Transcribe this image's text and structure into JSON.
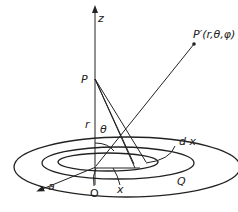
{
  "figure": {
    "labels": {
      "z_axis": "z",
      "field_point_general": "P′(r,θ,φ)",
      "field_point_axis": "P",
      "distance_r": "r",
      "angle_theta": "θ",
      "element_width": "d x",
      "ring_radius": "x",
      "origin": "O",
      "radius_a": "a",
      "outer_edge": "Q"
    },
    "colors": {
      "stroke": "#222222",
      "background": "#ffffff"
    }
  }
}
